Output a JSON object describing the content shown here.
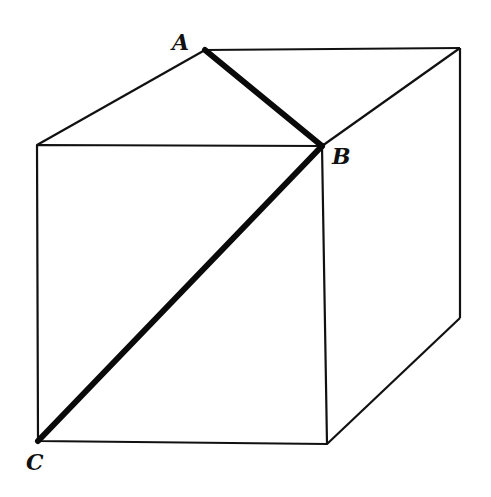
{
  "diagram": {
    "type": "cube-perspective",
    "stroke_color": "#111111",
    "highlight_color": "#0a0a0a",
    "vertices": {
      "front_top_left": [
        37,
        145
      ],
      "front_top_right": [
        322,
        146
      ],
      "front_bottom_right": [
        327,
        444
      ],
      "front_bottom_left": [
        38,
        441
      ],
      "back_top_left": [
        205,
        50
      ],
      "back_top_right": [
        460,
        48
      ],
      "back_bottom_right": [
        460,
        318
      ]
    },
    "labels": [
      {
        "text": "A",
        "x": 172,
        "y": 50
      },
      {
        "text": "B",
        "x": 332,
        "y": 164
      },
      {
        "text": "C",
        "x": 26,
        "y": 470
      }
    ],
    "highlighted_segments": [
      {
        "name": "AB",
        "from": "A",
        "to": "B"
      },
      {
        "name": "BC",
        "from": "B",
        "to": "C"
      }
    ]
  }
}
